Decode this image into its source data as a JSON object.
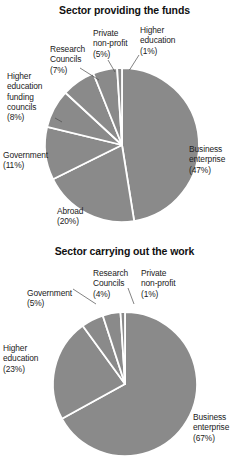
{
  "page": {
    "background_color": "#ffffff",
    "slice_color": "#8a8a8a",
    "separator_color": "#ffffff",
    "text_color": "#222222"
  },
  "chart_data": [
    {
      "type": "pie",
      "title": "Sector providing the funds",
      "xlabel": "",
      "ylabel": "",
      "legend": "none",
      "grid": false,
      "start_angle_deg": 0,
      "direction": "clockwise",
      "categories": [
        "Business enterprise",
        "Abroad",
        "Government",
        "Higher education funding councils",
        "Research Councils",
        "Private non-profit",
        "Higher education"
      ],
      "values": [
        47,
        20,
        11,
        8,
        7,
        5,
        1
      ],
      "units": "percent",
      "labels": [
        {
          "name": "Business enterprise",
          "name_line_1": "Business",
          "name_line_2": "enterprise",
          "pct": "(47%)"
        },
        {
          "name": "Abroad",
          "name_line_1": "Abroad",
          "name_line_2": "",
          "pct": "(20%)"
        },
        {
          "name": "Government",
          "name_line_1": "Government",
          "name_line_2": "",
          "pct": "(11%)"
        },
        {
          "name": "Higher education funding councils",
          "name_line_1": "Higher",
          "name_line_2": "education",
          "name_line_3": "funding",
          "name_line_4": "councils",
          "pct": "(8%)"
        },
        {
          "name": "Research Councils",
          "name_line_1": "Research",
          "name_line_2": "Councils",
          "pct": "(7%)"
        },
        {
          "name": "Private non-profit",
          "name_line_1": "Private",
          "name_line_2": "non-profit",
          "pct": "(5%)"
        },
        {
          "name": "Higher education",
          "name_line_1": "Higher",
          "name_line_2": "education",
          "pct": "(1%)"
        }
      ]
    },
    {
      "type": "pie",
      "title": "Sector carrying out the work",
      "xlabel": "",
      "ylabel": "",
      "legend": "none",
      "grid": false,
      "start_angle_deg": 0,
      "direction": "clockwise",
      "categories": [
        "Business enterprise",
        "Higher education",
        "Government",
        "Research Councils",
        "Private non-profit"
      ],
      "values": [
        67,
        23,
        5,
        4,
        1
      ],
      "units": "percent",
      "labels": [
        {
          "name": "Business enterprise",
          "name_line_1": "Business",
          "name_line_2": "enterprise",
          "pct": "(67%)"
        },
        {
          "name": "Higher education",
          "name_line_1": "Higher",
          "name_line_2": "education",
          "pct": "(23%)"
        },
        {
          "name": "Government",
          "name_line_1": "Government",
          "name_line_2": "",
          "pct": "(5%)"
        },
        {
          "name": "Research Councils",
          "name_line_1": "Research",
          "name_line_2": "Councils",
          "pct": "(4%)"
        },
        {
          "name": "Private non-profit",
          "name_line_1": "Private",
          "name_line_2": "non-profit",
          "pct": "(1%)"
        }
      ]
    }
  ]
}
